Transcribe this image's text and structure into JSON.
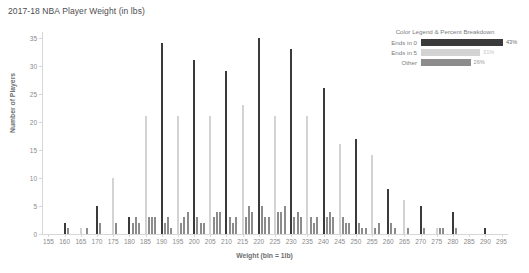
{
  "chart_data": {
    "type": "bar",
    "title": "2017-18 NBA Player Weight (in lbs)",
    "xlabel": "Weight (bin = 1lb)",
    "ylabel": "Number of Players",
    "xlim": [
      153,
      297
    ],
    "ylim": [
      0,
      36
    ],
    "grid": false,
    "x_ticks": [
      155,
      160,
      165,
      170,
      175,
      180,
      185,
      190,
      195,
      200,
      205,
      210,
      215,
      220,
      225,
      230,
      235,
      240,
      245,
      250,
      255,
      260,
      265,
      270,
      275,
      280,
      285,
      290,
      295
    ],
    "y_ticks": [
      0,
      5,
      10,
      15,
      20,
      25,
      30,
      35
    ],
    "series": [
      {
        "name": "Ends in 0",
        "color": "#3a3a3a",
        "points": [
          {
            "x": 160,
            "y": 2
          },
          {
            "x": 170,
            "y": 5
          },
          {
            "x": 180,
            "y": 3
          },
          {
            "x": 185,
            "y": 1
          },
          {
            "x": 190,
            "y": 34
          },
          {
            "x": 200,
            "y": 31
          },
          {
            "x": 210,
            "y": 29
          },
          {
            "x": 220,
            "y": 35
          },
          {
            "x": 230,
            "y": 33
          },
          {
            "x": 240,
            "y": 26
          },
          {
            "x": 250,
            "y": 17
          },
          {
            "x": 260,
            "y": 8
          },
          {
            "x": 270,
            "y": 5
          },
          {
            "x": 280,
            "y": 4
          },
          {
            "x": 290,
            "y": 1
          }
        ]
      },
      {
        "name": "Ends in 5",
        "color": "#d3d3d3",
        "points": [
          {
            "x": 165,
            "y": 1
          },
          {
            "x": 175,
            "y": 10
          },
          {
            "x": 185,
            "y": 21
          },
          {
            "x": 195,
            "y": 21
          },
          {
            "x": 205,
            "y": 21
          },
          {
            "x": 215,
            "y": 23
          },
          {
            "x": 225,
            "y": 21
          },
          {
            "x": 235,
            "y": 21
          },
          {
            "x": 245,
            "y": 16
          },
          {
            "x": 255,
            "y": 14
          },
          {
            "x": 265,
            "y": 6
          },
          {
            "x": 275,
            "y": 1
          },
          {
            "x": 285,
            "y": 0
          }
        ]
      },
      {
        "name": "Other",
        "color": "#8c8c8c",
        "points": [
          {
            "x": 161,
            "y": 1
          },
          {
            "x": 167,
            "y": 1
          },
          {
            "x": 171,
            "y": 2
          },
          {
            "x": 176,
            "y": 2
          },
          {
            "x": 181,
            "y": 2
          },
          {
            "x": 182,
            "y": 3
          },
          {
            "x": 183,
            "y": 2
          },
          {
            "x": 186,
            "y": 3
          },
          {
            "x": 187,
            "y": 3
          },
          {
            "x": 188,
            "y": 3
          },
          {
            "x": 191,
            "y": 2
          },
          {
            "x": 192,
            "y": 3
          },
          {
            "x": 193,
            "y": 1
          },
          {
            "x": 196,
            "y": 2
          },
          {
            "x": 197,
            "y": 3
          },
          {
            "x": 198,
            "y": 4
          },
          {
            "x": 201,
            "y": 3
          },
          {
            "x": 202,
            "y": 2
          },
          {
            "x": 203,
            "y": 2
          },
          {
            "x": 206,
            "y": 3
          },
          {
            "x": 207,
            "y": 4
          },
          {
            "x": 208,
            "y": 4
          },
          {
            "x": 211,
            "y": 3
          },
          {
            "x": 212,
            "y": 2
          },
          {
            "x": 213,
            "y": 3
          },
          {
            "x": 216,
            "y": 3
          },
          {
            "x": 217,
            "y": 5
          },
          {
            "x": 218,
            "y": 4
          },
          {
            "x": 221,
            "y": 5
          },
          {
            "x": 222,
            "y": 3
          },
          {
            "x": 223,
            "y": 3
          },
          {
            "x": 226,
            "y": 4
          },
          {
            "x": 227,
            "y": 4
          },
          {
            "x": 228,
            "y": 5
          },
          {
            "x": 231,
            "y": 3
          },
          {
            "x": 232,
            "y": 4
          },
          {
            "x": 233,
            "y": 3
          },
          {
            "x": 236,
            "y": 3
          },
          {
            "x": 237,
            "y": 2
          },
          {
            "x": 238,
            "y": 3
          },
          {
            "x": 241,
            "y": 3
          },
          {
            "x": 242,
            "y": 4
          },
          {
            "x": 243,
            "y": 3
          },
          {
            "x": 246,
            "y": 3
          },
          {
            "x": 247,
            "y": 2
          },
          {
            "x": 248,
            "y": 2
          },
          {
            "x": 251,
            "y": 2
          },
          {
            "x": 252,
            "y": 1
          },
          {
            "x": 253,
            "y": 1
          },
          {
            "x": 256,
            "y": 1
          },
          {
            "x": 257,
            "y": 2
          },
          {
            "x": 261,
            "y": 2
          },
          {
            "x": 262,
            "y": 1
          },
          {
            "x": 266,
            "y": 1
          },
          {
            "x": 271,
            "y": 1
          },
          {
            "x": 276,
            "y": 1
          },
          {
            "x": 277,
            "y": 1
          },
          {
            "x": 281,
            "y": 1
          }
        ]
      }
    ]
  },
  "legend": {
    "title": "Color Legend & Percent Breakdown",
    "rows": [
      {
        "label": "Ends in 0",
        "percent": "43%",
        "value": 43,
        "color": "#3a3a3a",
        "pct_color": "#6d6e70"
      },
      {
        "label": "Ends in 5",
        "percent": "31%",
        "value": 31,
        "color": "#d3d3d3",
        "pct_color": "#c4c4c4"
      },
      {
        "label": "Other",
        "percent": "26%",
        "value": 26,
        "color": "#8c8c8c",
        "pct_color": "#9a9a9a"
      }
    ]
  }
}
